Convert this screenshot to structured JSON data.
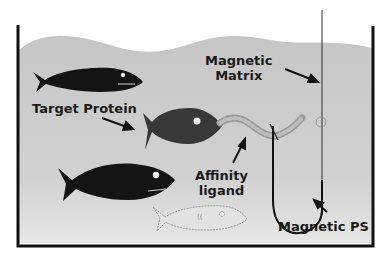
{
  "diagram": {
    "labels": {
      "magnetic_matrix_line1": "Magnetic",
      "magnetic_matrix_line2": "Matrix",
      "target_protein": "Target Protein",
      "affinity_ligand_line1": "Affinity",
      "affinity_ligand_line2": "ligand",
      "magnetic_ps": "Magnetic PS"
    },
    "colors": {
      "water": "#c9c9c9",
      "water_light": "#e2e2e2",
      "tank_border": "#111111",
      "fish_dark": "#141414",
      "target_fish": "#3a3a3a",
      "ligand": "#a8a8a8",
      "ghost_fish_fill": "#e0e0e0"
    }
  }
}
